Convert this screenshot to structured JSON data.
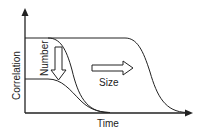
{
  "diagram": {
    "xlabel": "Time",
    "ylabel": "Correlation",
    "annotations": [
      {
        "text": "Number",
        "arrow": "down"
      },
      {
        "text": "Size",
        "arrow": "right"
      }
    ],
    "curves": [
      {
        "name": "small-size-high",
        "description": "high plateau, early decay"
      },
      {
        "name": "small-size-low",
        "description": "low plateau, early decay"
      },
      {
        "name": "large-size-high",
        "description": "high plateau, late decay"
      }
    ],
    "line_color": "#222222"
  }
}
